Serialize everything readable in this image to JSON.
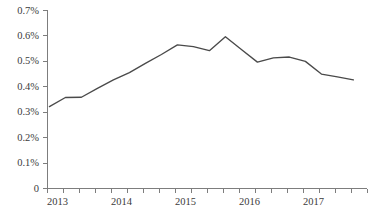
{
  "chart_data": {
    "type": "line",
    "title": "",
    "subtitle": "",
    "xlabel": "",
    "ylabel": "",
    "grid": false,
    "legend": null,
    "legend_position": "none",
    "ylim": [
      0,
      0.7
    ],
    "y_tick_labels": [
      "0.7%",
      "0.6%",
      "0.5%",
      "0.4%",
      "0.3%",
      "0.2%",
      "0.1%",
      "0"
    ],
    "y_tick_values": [
      0.7,
      0.6,
      0.5,
      0.4,
      0.3,
      0.2,
      0.1,
      0
    ],
    "x_tick_labels": [
      "2013",
      "2014",
      "2015",
      "2016",
      "2017"
    ],
    "x_tick_label_values": [
      2013,
      2014,
      2015,
      2016,
      2017
    ],
    "x_minor_tick_count": 20,
    "x_tick_interval": "quarterly",
    "units": "percent",
    "line_color": "#4a4a4a",
    "axis_color": "#7d7d7d",
    "text_color": "#3b3b3b",
    "background_color": "#ffffff",
    "x": [
      "2013 Q1",
      "2013 Q2",
      "2013 Q3",
      "2013 Q4",
      "2014 Q1",
      "2014 Q2",
      "2014 Q3",
      "2014 Q4",
      "2015 Q1",
      "2015 Q2",
      "2015 Q3",
      "2015 Q4",
      "2016 Q1",
      "2016 Q2",
      "2016 Q3",
      "2016 Q4",
      "2017 Q1",
      "2017 Q2",
      "2017 Q3",
      "2017 Q4"
    ],
    "values": [
      0.32,
      0.356,
      0.357,
      0.392,
      0.425,
      0.454,
      0.49,
      0.525,
      0.563,
      0.556,
      0.54,
      0.595,
      0.545,
      0.495,
      0.512,
      0.515,
      0.498,
      0.448,
      0.437,
      0.425
    ],
    "series": [
      {
        "name": "series-1",
        "color": "#4a4a4a",
        "values": [
          0.32,
          0.356,
          0.357,
          0.392,
          0.425,
          0.454,
          0.49,
          0.525,
          0.563,
          0.556,
          0.54,
          0.595,
          0.545,
          0.495,
          0.512,
          0.515,
          0.498,
          0.448,
          0.437,
          0.425
        ]
      }
    ]
  },
  "plot": {
    "left": 47,
    "right": 367,
    "top": 10,
    "bottom": 188
  }
}
